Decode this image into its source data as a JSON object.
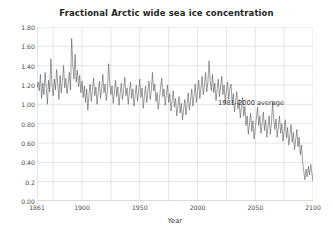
{
  "chart_data": {
    "type": "line",
    "title": "Fractional Arctic wide sea ice concentration",
    "xlabel": "Year",
    "ylabel": "",
    "xlim": [
      1861,
      2100
    ],
    "ylim": [
      0.0,
      1.8
    ],
    "grid": true,
    "legend": "none",
    "y_ticks": [
      "0.00",
      "0.2",
      "0.40",
      "0.60",
      "0.80",
      "1.00",
      "1.20",
      "1.40",
      "1.60",
      "1.80"
    ],
    "y_tick_values": [
      0.0,
      0.2,
      0.4,
      0.6,
      0.8,
      1.0,
      1.2,
      1.4,
      1.6,
      1.8
    ],
    "x_ticks": [
      "1861",
      "1900",
      "1950",
      "2000",
      "2050",
      "2100"
    ],
    "x_tick_values": [
      1861,
      1900,
      1950,
      2000,
      2050,
      2100
    ],
    "annotations": [
      {
        "text": "1981–2000 average",
        "x": 2055,
        "y": 1.06
      }
    ],
    "line_color": "#4d4d4d",
    "grid_color": "#c8c8c8",
    "series": [
      {
        "name": "Fractional Arctic wide sea ice concentration",
        "x_start": 1861,
        "x_step": 1,
        "values": [
          1.17,
          1.23,
          1.14,
          1.31,
          1.06,
          1.22,
          1.1,
          1.33,
          1.18,
          1.0,
          1.25,
          1.13,
          1.47,
          1.19,
          1.09,
          1.26,
          1.15,
          1.36,
          1.21,
          1.05,
          1.3,
          1.12,
          1.24,
          1.4,
          1.17,
          1.27,
          1.11,
          1.21,
          1.33,
          1.15,
          1.68,
          1.41,
          1.26,
          1.52,
          1.23,
          1.35,
          1.18,
          1.3,
          1.12,
          1.24,
          1.07,
          1.19,
          1.02,
          1.16,
          0.94,
          1.1,
          1.21,
          1.03,
          1.15,
          1.27,
          1.09,
          1.18,
          1.0,
          1.13,
          1.24,
          1.06,
          1.16,
          1.31,
          1.12,
          1.21,
          1.04,
          1.14,
          1.42,
          1.22,
          1.1,
          1.19,
          1.01,
          1.13,
          1.25,
          1.08,
          1.18,
          0.99,
          1.11,
          1.22,
          1.05,
          1.15,
          1.28,
          1.09,
          1.17,
          1.0,
          1.12,
          1.23,
          1.06,
          1.16,
          0.98,
          1.1,
          1.2,
          1.03,
          1.14,
          1.26,
          1.07,
          1.17,
          0.96,
          1.09,
          1.19,
          1.02,
          1.13,
          1.24,
          1.05,
          1.15,
          1.33,
          1.14,
          1.21,
          1.03,
          1.12,
          0.95,
          1.06,
          1.17,
          1.27,
          1.08,
          1.16,
          0.99,
          1.09,
          1.2,
          1.02,
          1.11,
          0.93,
          1.04,
          1.14,
          0.97,
          1.06,
          0.88,
          0.98,
          1.08,
          0.91,
          1.01,
          0.84,
          0.95,
          1.05,
          0.89,
          1.0,
          1.12,
          0.94,
          1.04,
          1.16,
          0.98,
          1.09,
          1.21,
          1.02,
          1.13,
          1.25,
          1.06,
          1.17,
          1.29,
          1.1,
          1.2,
          1.33,
          1.13,
          1.23,
          1.45,
          1.24,
          1.14,
          1.31,
          1.12,
          1.22,
          1.04,
          1.15,
          1.26,
          1.08,
          1.18,
          1.29,
          1.1,
          1.2,
          1.02,
          1.13,
          1.23,
          1.05,
          1.16,
          1.21,
          1.01,
          1.11,
          0.92,
          1.03,
          1.13,
          0.95,
          1.05,
          0.86,
          0.96,
          1.07,
          0.88,
          0.98,
          0.78,
          0.88,
          0.69,
          0.8,
          0.91,
          0.72,
          0.83,
          0.64,
          0.75,
          0.86,
          0.97,
          0.78,
          0.88,
          0.7,
          0.81,
          0.92,
          0.73,
          0.84,
          0.66,
          0.77,
          0.88,
          0.69,
          0.8,
          1.03,
          0.84,
          0.74,
          0.85,
          0.66,
          0.77,
          0.88,
          0.7,
          0.8,
          0.62,
          0.73,
          0.84,
          0.65,
          0.76,
          0.58,
          0.68,
          0.79,
          0.61,
          0.71,
          0.53,
          0.63,
          0.74,
          0.56,
          0.66,
          0.48,
          0.58,
          0.4,
          0.31,
          0.22,
          0.33,
          0.25,
          0.36,
          0.27,
          0.38,
          0.29,
          0.21,
          0.32,
          0.24,
          0.35,
          0.26,
          0.18,
          0.29,
          0.4,
          0.31,
          0.23,
          0.34,
          0.26,
          0.17,
          0.28,
          0.2,
          0.31,
          0.23,
          0.14,
          0.25,
          0.36,
          0.28,
          0.19,
          0.3,
          0.22,
          0.13,
          0.24,
          0.16,
          0.27,
          0.18,
          0.55,
          0.3,
          0.21,
          0.12,
          0.23,
          0.15,
          0.26,
          0.17,
          0.09,
          0.2,
          0.12,
          0.23,
          0.14,
          0.06,
          0.17,
          0.1,
          0.21,
          0.13,
          0.24,
          0.16,
          0.08,
          0.19
        ]
      }
    ]
  }
}
